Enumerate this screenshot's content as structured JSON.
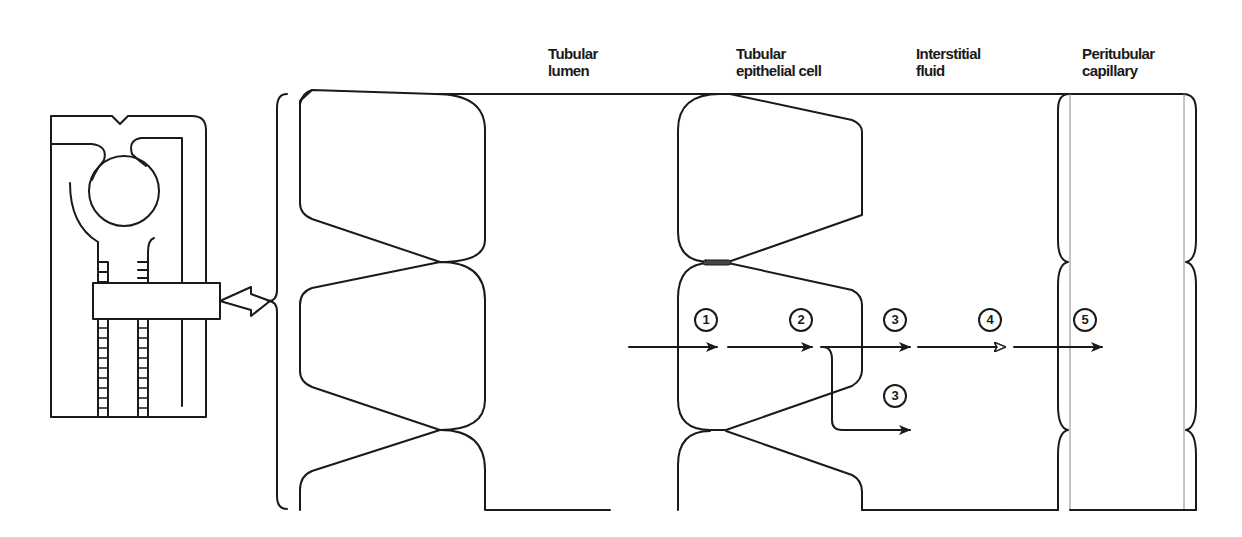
{
  "diagram": {
    "colors": {
      "stroke": "#1a1a1a",
      "background": "#ffffff",
      "junction": "#444444"
    },
    "compartments": [
      {
        "id": "tubular-lumen",
        "label": "Tubular\nlumen"
      },
      {
        "id": "tubular-epithelial-cell",
        "label": "Tubular\nepithelial cell"
      },
      {
        "id": "interstitial-fluid",
        "label": "Interstitial\nfluid"
      },
      {
        "id": "peritubular-capillary",
        "label": "Peritubular\ncapillary"
      }
    ],
    "steps": [
      {
        "number": "1",
        "position": "apical membrane entry"
      },
      {
        "number": "2",
        "position": "across cytoplasm"
      },
      {
        "number": "3",
        "position": "basolateral exit (transcellular)"
      },
      {
        "number": "3",
        "position": "lateral intercellular exit"
      },
      {
        "number": "4",
        "position": "through interstitial fluid"
      },
      {
        "number": "5",
        "position": "into peritubular capillary"
      }
    ],
    "inset": {
      "description": "nephron schematic with magnified tubule segment"
    }
  }
}
